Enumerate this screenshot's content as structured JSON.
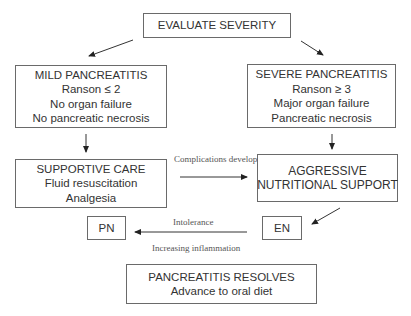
{
  "nodes": {
    "evaluate": {
      "lines": [
        "EVALUATE SEVERITY"
      ]
    },
    "mild": {
      "lines": [
        "MILD PANCREATITIS",
        "Ranson ≤ 2",
        "No organ failure",
        "No pancreatic necrosis"
      ]
    },
    "severe": {
      "lines": [
        "SEVERE PANCREATITIS",
        "Ranson ≥ 3",
        "Major organ failure",
        "Pancreatic necrosis"
      ]
    },
    "supportive": {
      "lines": [
        "SUPPORTIVE CARE",
        "Fluid resuscitation",
        "Analgesia"
      ]
    },
    "aggressive": {
      "lines": [
        "AGGRESSIVE",
        "NUTRITIONAL SUPPORT"
      ]
    },
    "pn": {
      "lines": [
        "PN"
      ]
    },
    "en": {
      "lines": [
        "EN"
      ]
    },
    "resolves": {
      "lines": [
        "PANCREATITIS RESOLVES",
        "Advance to oral diet"
      ]
    }
  },
  "edges": {
    "complications": {
      "label": "Complications develop",
      "from": "supportive",
      "to": "aggressive"
    },
    "intolerance": {
      "label": "Intolerance",
      "from": "en",
      "to": "pn"
    },
    "inflammation": {
      "label": "Increasing inflammation"
    }
  }
}
